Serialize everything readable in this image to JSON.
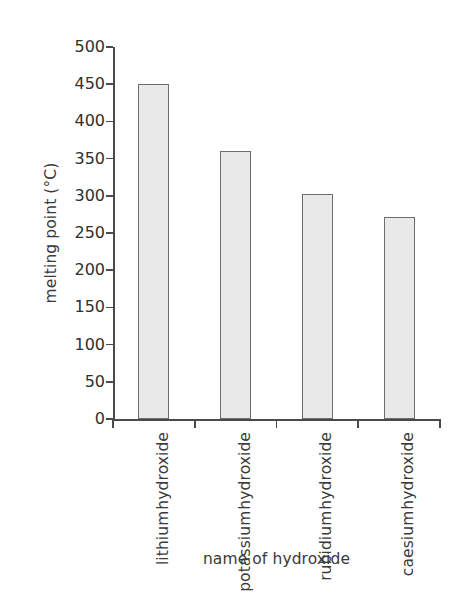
{
  "chart_data": {
    "type": "bar",
    "title": "",
    "xlabel": "name of hydroxide",
    "ylabel": "melting point (°C)",
    "categories": [
      "lithium hydroxide",
      "potassium hydroxide",
      "rubidium hydroxide",
      "caesium hydroxide"
    ],
    "category_lines": [
      [
        "lithium",
        "hydroxide"
      ],
      [
        "potassium",
        "hydroxide"
      ],
      [
        "rubidium",
        "hydroxide"
      ],
      [
        "caesium",
        "hydroxide"
      ]
    ],
    "values": [
      450,
      360,
      302,
      272
    ],
    "ylim": [
      0,
      500
    ],
    "yticks": [
      0,
      50,
      100,
      150,
      200,
      250,
      300,
      350,
      400,
      450,
      500
    ],
    "ytick_labels": [
      "0",
      "50",
      "100",
      "150",
      "200",
      "250",
      "300",
      "350",
      "400",
      "450",
      "500"
    ],
    "grid": false,
    "legend": false,
    "bar_fill": "#e9e9e9",
    "bar_stroke": "#6d6d6d",
    "axis_color": "#4a4a4a",
    "background": "#ffffff"
  }
}
